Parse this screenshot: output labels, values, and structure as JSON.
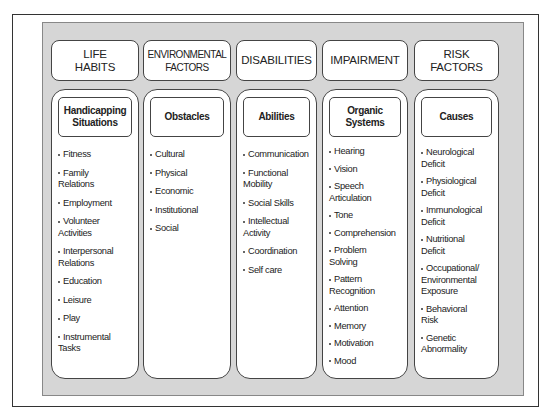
{
  "columns": [
    {
      "header": "LIFE\nHABITS",
      "subheader": "Handicapping\nSituations",
      "items": [
        "Fitness",
        "Family\nRelations",
        "Employment",
        "Volunteer\nActivities",
        "Interpersonal\nRelations",
        "Education",
        "Leisure",
        "Play",
        "Instrumental\nTasks"
      ]
    },
    {
      "header": "ENVIRONMENTAL\nFACTORS",
      "subheader": "Obstacles",
      "items": [
        "Cultural",
        "Physical",
        "Economic",
        "Institutional",
        "Social"
      ]
    },
    {
      "header": "DISABILITIES",
      "subheader": "Abilities",
      "items": [
        "Communication",
        "Functional\nMobility",
        "Social Skills",
        "Intellectual\nActivity",
        "Coordination",
        "Self care"
      ]
    },
    {
      "header": "IMPAIRMENT",
      "subheader": "Organic\nSystems",
      "items": [
        "Hearing",
        "Vision",
        "Speech\nArticulation",
        "Tone",
        "Comprehension",
        "Problem\nSolving",
        "Pattern\nRecognition",
        "Attention",
        "Memory",
        "Motivation",
        "Mood"
      ]
    },
    {
      "header": "RISK\nFACTORS",
      "subheader": "Causes",
      "items": [
        "Neurological\nDeficit",
        "Physiological\nDeficit",
        "Immunological\nDeficit",
        "Nutritional\nDeficit",
        "Occupational/\nEnvironmental\nExposure",
        "Behavioral\nRisk",
        "Genetic\nAbnormality"
      ]
    }
  ],
  "colors": {
    "panel_background": "#d6d6d6",
    "box_background": "#ffffff",
    "border": "#444444"
  }
}
